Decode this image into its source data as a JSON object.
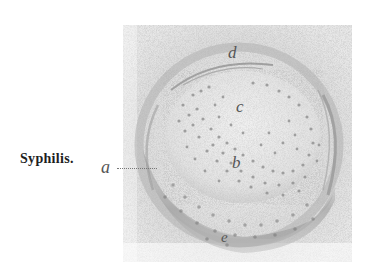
{
  "figure": {
    "caption": "Syphilis.",
    "labels": {
      "a": "a",
      "b": "b",
      "c": "c",
      "d": "d",
      "e": "e"
    },
    "colors": {
      "background": "#ffffff",
      "stipple_light": "#d8d8d8",
      "stipple_mid": "#b5b5b5",
      "stipple_dark": "#8f8f8f",
      "label": "#555555",
      "caption": "#1e1e1e"
    }
  }
}
